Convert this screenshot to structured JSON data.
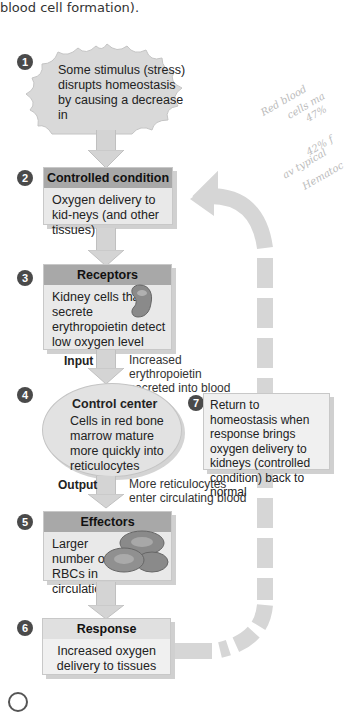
{
  "caption": "blood cell formation).",
  "steps": [
    {
      "num": "1",
      "title": "",
      "text": "Some stimulus (stress) disrupts homeostasis by causing a decrease in"
    },
    {
      "num": "2",
      "title": "Controlled condition",
      "text": "Oxygen delivery to kid-neys (and other tissues)"
    },
    {
      "num": "3",
      "title": "Receptors",
      "text": "Kidney cells that secrete erythropoietin detect low oxygen level"
    },
    {
      "num": "4",
      "title": "Control center",
      "text": "Cells in red bone marrow mature more quickly into reticulocytes"
    },
    {
      "num": "5",
      "title": "Effectors",
      "text": "Larger number of RBCs in circulation"
    },
    {
      "num": "6",
      "title": "Response",
      "text": "Increased oxygen delivery to tissues"
    },
    {
      "num": "7",
      "title": "",
      "text": "Return to homeostasis when response brings oxygen delivery to kidneys (controlled condition) back to normal"
    }
  ],
  "input": {
    "label": "Input",
    "text": "Increased erythropoietin secreted into blood"
  },
  "output": {
    "label": "Output",
    "text": "More reticulocytes enter circulating blood"
  },
  "handwritten": [
    "Red blood",
    "cells ma",
    "47%",
    "42% f",
    "av typical",
    "Hematoc"
  ],
  "icons": {
    "kidney": "kidney-icon",
    "rbc": "red-blood-cells-icon"
  },
  "colors": {
    "header": "#a8a8a8",
    "box": "#e9e9e9",
    "arrow": "#d4d4d4",
    "badge": "#4a4a4a"
  }
}
